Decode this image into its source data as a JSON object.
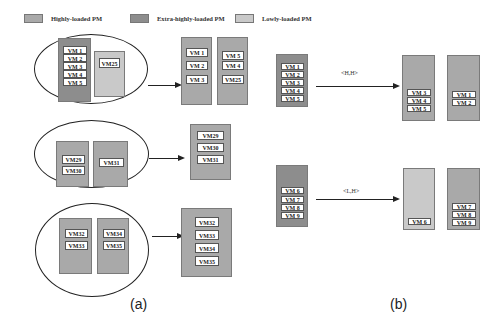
{
  "legend": {
    "items": [
      {
        "label": "Highly-loaded PM",
        "color": "#a9a9a9"
      },
      {
        "label": "Extra-highly-loaded PM",
        "color": "#8d8d8d"
      },
      {
        "label": "Lowly-loaded PM",
        "color": "#c9c9c9"
      }
    ]
  },
  "panel_a": {
    "label": "(a)",
    "groups": [
      {
        "before": [
          {
            "type": "extra",
            "vms": [
              "VM 1",
              "VM 2",
              "VM 3",
              "VM 4",
              "VM 5"
            ]
          },
          {
            "type": "low",
            "vms": [
              "VM25"
            ]
          }
        ],
        "after": [
          {
            "type": "high",
            "vms": [
              "VM 1",
              "VM 2",
              "VM 3"
            ]
          },
          {
            "type": "high",
            "vms": [
              "VM 5",
              "VM 4",
              "VM25"
            ]
          }
        ]
      },
      {
        "before": [
          {
            "type": "high",
            "vms": [
              "VM29",
              "VM30"
            ]
          },
          {
            "type": "high",
            "vms": [
              "VM31"
            ]
          }
        ],
        "after": [
          {
            "type": "high",
            "vms": [
              "VM29",
              "VM30",
              "VM31"
            ]
          }
        ]
      },
      {
        "before": [
          {
            "type": "high",
            "vms": [
              "VM32",
              "VM33"
            ]
          },
          {
            "type": "high",
            "vms": [
              "VM34",
              "VM35"
            ]
          }
        ],
        "after": [
          {
            "type": "high",
            "vms": [
              "VM32",
              "VM33",
              "VM34",
              "VM35"
            ]
          }
        ]
      }
    ]
  },
  "panel_b": {
    "label": "(b)",
    "rows": [
      {
        "edge_label": "<H,H>",
        "before": {
          "type": "extra",
          "vms": [
            "VM 1",
            "VM 2",
            "VM 3",
            "VM 4",
            "VM 5"
          ]
        },
        "after": [
          {
            "type": "high",
            "vms": [
              "VM 3",
              "VM 4",
              "VM 5"
            ]
          },
          {
            "type": "high",
            "vms": [
              "VM 1",
              "VM 2"
            ]
          }
        ]
      },
      {
        "edge_label": "<L,H>",
        "before": {
          "type": "extra",
          "vms": [
            "VM 6",
            "VM 7",
            "VM 8",
            "VM 9"
          ]
        },
        "after": [
          {
            "type": "low",
            "vms": [
              "VM 6"
            ]
          },
          {
            "type": "high",
            "vms": [
              "VM 7",
              "VM 8",
              "VM 9"
            ]
          }
        ]
      }
    ]
  }
}
